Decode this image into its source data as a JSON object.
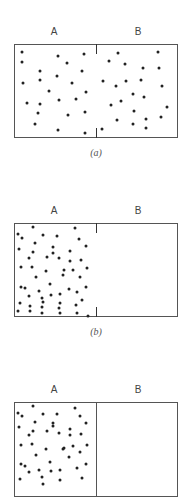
{
  "figure": {
    "panels": [
      {
        "id": "a",
        "caption": "(a)",
        "left_label": "A",
        "right_label": "B",
        "partition": "open-slit",
        "top": 44,
        "height": 94,
        "dots_A": [
          [
            22,
            52
          ],
          [
            22,
            62
          ],
          [
            58,
            56
          ],
          [
            67,
            63
          ],
          [
            84,
            54
          ],
          [
            40,
            71
          ],
          [
            57,
            76
          ],
          [
            82,
            71
          ],
          [
            23,
            83
          ],
          [
            40,
            80
          ],
          [
            72,
            83
          ],
          [
            49,
            91
          ],
          [
            86,
            92
          ],
          [
            27,
            103
          ],
          [
            40,
            104
          ],
          [
            59,
            100
          ],
          [
            76,
            99
          ],
          [
            38,
            113
          ],
          [
            68,
            115
          ],
          [
            85,
            112
          ],
          [
            35,
            124
          ],
          [
            58,
            130
          ],
          [
            85,
            133
          ]
        ],
        "dots_B": [
          [
            118,
            53
          ],
          [
            158,
            52
          ],
          [
            109,
            61
          ],
          [
            125,
            64
          ],
          [
            143,
            68
          ],
          [
            159,
            68
          ],
          [
            103,
            81
          ],
          [
            116,
            86
          ],
          [
            126,
            81
          ],
          [
            141,
            80
          ],
          [
            162,
            86
          ],
          [
            133,
            94
          ],
          [
            144,
            97
          ],
          [
            121,
            101
          ],
          [
            111,
            105
          ],
          [
            167,
            107
          ],
          [
            134,
            111
          ],
          [
            117,
            120
          ],
          [
            161,
            117
          ],
          [
            146,
            119
          ],
          [
            133,
            124
          ],
          [
            146,
            128
          ],
          [
            102,
            129
          ]
        ]
      },
      {
        "id": "b",
        "caption": "(b)",
        "left_label": "A",
        "right_label": "B",
        "partition": "open-slit",
        "top": 223,
        "height": 94,
        "dots_A": [
          [
            33,
            227
          ],
          [
            75,
            228
          ],
          [
            18,
            234
          ],
          [
            22,
            238
          ],
          [
            43,
            235
          ],
          [
            57,
            236
          ],
          [
            79,
            239
          ],
          [
            35,
            243
          ],
          [
            53,
            247
          ],
          [
            86,
            246
          ],
          [
            19,
            249
          ],
          [
            33,
            252
          ],
          [
            53,
            253
          ],
          [
            70,
            251
          ],
          [
            29,
            258
          ],
          [
            47,
            257
          ],
          [
            59,
            258
          ],
          [
            70,
            261
          ],
          [
            81,
            260
          ],
          [
            21,
            267
          ],
          [
            32,
            267
          ],
          [
            46,
            271
          ],
          [
            64,
            270
          ],
          [
            73,
            270
          ],
          [
            87,
            268
          ],
          [
            36,
            277
          ],
          [
            63,
            275
          ],
          [
            80,
            277
          ],
          [
            21,
            287
          ],
          [
            25,
            288
          ],
          [
            50,
            284
          ],
          [
            86,
            287
          ],
          [
            39,
            291
          ],
          [
            29,
            296
          ],
          [
            51,
            295
          ],
          [
            60,
            294
          ],
          [
            77,
            292
          ],
          [
            69,
            289
          ],
          [
            20,
            303
          ],
          [
            42,
            298
          ],
          [
            60,
            303
          ],
          [
            43,
            302
          ],
          [
            82,
            300
          ],
          [
            30,
            306
          ],
          [
            42,
            307
          ],
          [
            59,
            308
          ],
          [
            76,
            305
          ],
          [
            18,
            311
          ],
          [
            30,
            311
          ],
          [
            42,
            313
          ],
          [
            60,
            313
          ],
          [
            77,
            313
          ],
          [
            88,
            316
          ]
        ],
        "dots_B": []
      },
      {
        "id": "c",
        "caption": "",
        "left_label": "A",
        "right_label": "B",
        "partition": "closed-wall",
        "top": 402,
        "height": 95,
        "dots_A": [
          [
            33,
            406
          ],
          [
            75,
            408
          ],
          [
            18,
            413
          ],
          [
            22,
            416
          ],
          [
            43,
            414
          ],
          [
            57,
            414
          ],
          [
            80,
            416
          ],
          [
            35,
            422
          ],
          [
            53,
            423
          ],
          [
            86,
            423
          ],
          [
            19,
            427
          ],
          [
            33,
            431
          ],
          [
            53,
            426
          ],
          [
            70,
            429
          ],
          [
            29,
            435
          ],
          [
            47,
            431
          ],
          [
            59,
            433
          ],
          [
            70,
            435
          ],
          [
            81,
            434
          ],
          [
            21,
            445
          ],
          [
            32,
            444
          ],
          [
            46,
            449
          ],
          [
            64,
            448
          ],
          [
            73,
            446
          ],
          [
            87,
            445
          ],
          [
            36,
            455
          ],
          [
            63,
            449
          ],
          [
            80,
            452
          ],
          [
            21,
            464
          ],
          [
            25,
            466
          ],
          [
            50,
            462
          ],
          [
            86,
            464
          ],
          [
            39,
            470
          ],
          [
            29,
            472
          ],
          [
            51,
            471
          ],
          [
            60,
            470
          ],
          [
            77,
            468
          ],
          [
            69,
            457
          ],
          [
            20,
            479
          ],
          [
            42,
            477
          ],
          [
            60,
            480
          ],
          [
            43,
            484
          ],
          [
            82,
            478
          ]
        ],
        "dots_B": []
      }
    ]
  }
}
